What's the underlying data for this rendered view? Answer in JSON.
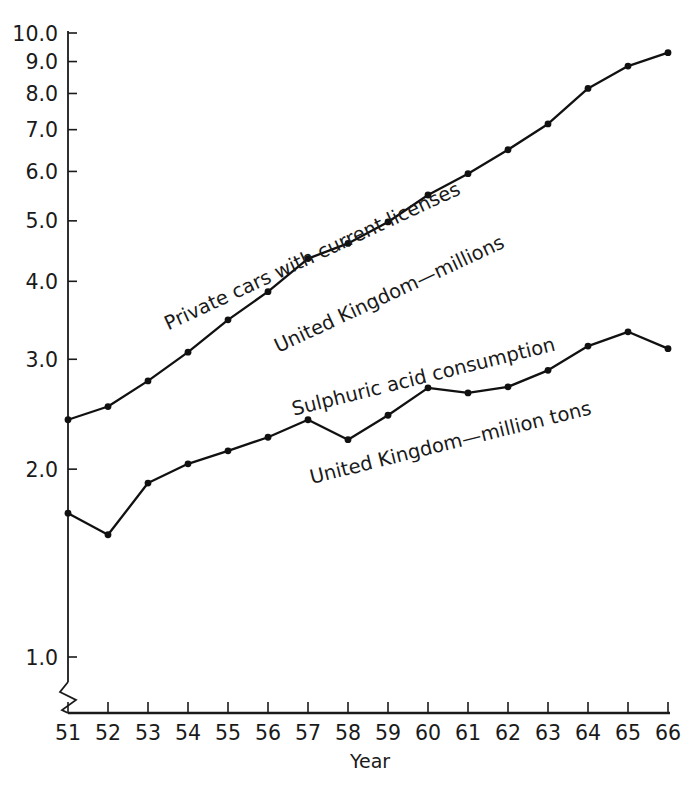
{
  "chart_data": {
    "type": "line",
    "title": "",
    "subtitle": "",
    "xlabel": "Year",
    "ylabel": "",
    "yscale": "log",
    "ylim": [
      1.0,
      10.0
    ],
    "grid": false,
    "legend_position": "inline-annotations",
    "x_tick_labels": [
      "51",
      "52",
      "53",
      "54",
      "55",
      "56",
      "57",
      "58",
      "59",
      "60",
      "61",
      "62",
      "63",
      "64",
      "65",
      "66"
    ],
    "x": [
      51,
      52,
      53,
      54,
      55,
      56,
      57,
      58,
      59,
      60,
      61,
      62,
      63,
      64,
      65,
      66
    ],
    "y_tick_labels": [
      "10.0",
      "9.0",
      "8.0",
      "7.0",
      "6.0",
      "5.0",
      "4.0",
      "3.0",
      "2.0",
      "1.0"
    ],
    "y_ticks": [
      10.0,
      9.0,
      8.0,
      7.0,
      6.0,
      5.0,
      4.0,
      3.0,
      2.0,
      1.0
    ],
    "axis_break": "y-axis broken below 1.0",
    "series": [
      {
        "name": "Private cars with current licenses United Kingdom—millions",
        "label_line1": "Private cars with current licenses",
        "label_line2": "United Kingdom—millions",
        "color": "#111111",
        "values": [
          2.4,
          2.52,
          2.77,
          3.08,
          3.47,
          3.85,
          4.35,
          4.6,
          4.98,
          5.5,
          5.95,
          6.5,
          7.15,
          8.15,
          8.85,
          9.3
        ]
      },
      {
        "name": "Sulphuric acid consumption United Kingdom—million tons",
        "label_line1": "Sulphuric acid consumption",
        "label_line2": "United Kingdom—million tons",
        "color": "#111111",
        "values": [
          1.7,
          1.57,
          1.9,
          2.04,
          2.14,
          2.25,
          2.4,
          2.23,
          2.44,
          2.7,
          2.65,
          2.71,
          2.88,
          3.15,
          3.32,
          3.12
        ]
      }
    ]
  },
  "annotations": {
    "upper_line1": "Private cars with current licenses",
    "upper_line2": "United Kingdom—millions",
    "lower_line1": "Sulphuric acid consumption",
    "lower_line2": "United Kingdom—million tons"
  },
  "axis": {
    "x_title": "Year"
  }
}
